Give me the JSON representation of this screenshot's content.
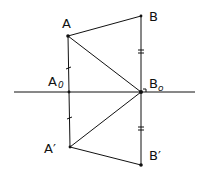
{
  "diagram": {
    "points": {
      "A": {
        "label": "A",
        "x": 68,
        "y": 36
      },
      "B": {
        "label": "B",
        "x": 141,
        "y": 16
      },
      "A0": {
        "label": "A",
        "sub": "0",
        "x": 69,
        "y": 92
      },
      "B0": {
        "label": "B",
        "sub": "o",
        "x": 141,
        "y": 92
      },
      "A1": {
        "label": "A′",
        "x": 70,
        "y": 147
      },
      "B1": {
        "label": "B′",
        "x": 141,
        "y": 165
      }
    },
    "axis": {
      "x1": 14,
      "x2": 195,
      "y": 92
    },
    "segments": [
      [
        "A",
        "B"
      ],
      [
        "A",
        "A0"
      ],
      [
        "A0",
        "A1"
      ],
      [
        "A",
        "B0"
      ],
      [
        "A1",
        "B0"
      ],
      [
        "A1",
        "B1"
      ],
      [
        "B",
        "B0"
      ],
      [
        "B0",
        "B1"
      ]
    ],
    "tick_marks": {
      "single": [
        "A-A0",
        "A0-A1"
      ],
      "double": [
        "B-B0",
        "B0-B1"
      ]
    },
    "right_angle_at": "B0",
    "stroke_color": "#111111"
  }
}
